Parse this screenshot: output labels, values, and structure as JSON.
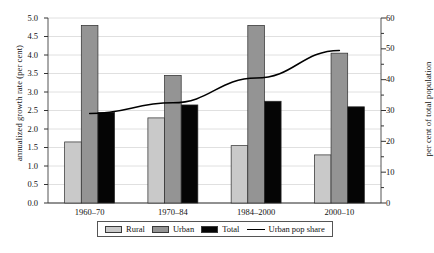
{
  "chart_data": {
    "type": "bar",
    "title": "",
    "xlabel": "",
    "ylabel": "annualized growth rate (per cent)",
    "y2label": "per cent of total population",
    "categories": [
      "1960–70",
      "1970–84",
      "1984–2000",
      "2000–10"
    ],
    "ylim": [
      0.0,
      5.0
    ],
    "y2lim": [
      0,
      60
    ],
    "yticks": [
      "0.0",
      "0.5",
      "1.0",
      "1.5",
      "2.0",
      "2.5",
      "3.0",
      "3.5",
      "4.0",
      "4.5",
      "5.0"
    ],
    "y2ticks": [
      "0",
      "10",
      "20",
      "30",
      "40",
      "50",
      "60"
    ],
    "grid": true,
    "legend_position": "bottom",
    "series": [
      {
        "name": "Rural",
        "type": "bar",
        "axis": "left",
        "color": "#c9c9c9",
        "values": [
          1.65,
          2.3,
          1.55,
          1.3
        ]
      },
      {
        "name": "Urban",
        "type": "bar",
        "axis": "left",
        "color": "#949494",
        "values": [
          4.8,
          3.45,
          4.8,
          4.05
        ]
      },
      {
        "name": "Total",
        "type": "bar",
        "axis": "left",
        "color": "#050505",
        "values": [
          2.45,
          2.65,
          2.75,
          2.6
        ]
      },
      {
        "name": "Urban pop share",
        "type": "line",
        "axis": "right",
        "color": "#000000",
        "values": [
          29.0,
          32.5,
          40.5,
          49.5
        ]
      }
    ]
  },
  "legend": {
    "items": [
      {
        "label": "Rural",
        "marker": "swatch-rural"
      },
      {
        "label": "Urban",
        "marker": "swatch-urban"
      },
      {
        "label": "Total",
        "marker": "swatch-total"
      },
      {
        "label": "Urban pop share",
        "marker": "line-marker"
      }
    ]
  },
  "axes": {
    "left_title": "annualized growth rate (per cent)",
    "right_title": "per cent of total population"
  }
}
